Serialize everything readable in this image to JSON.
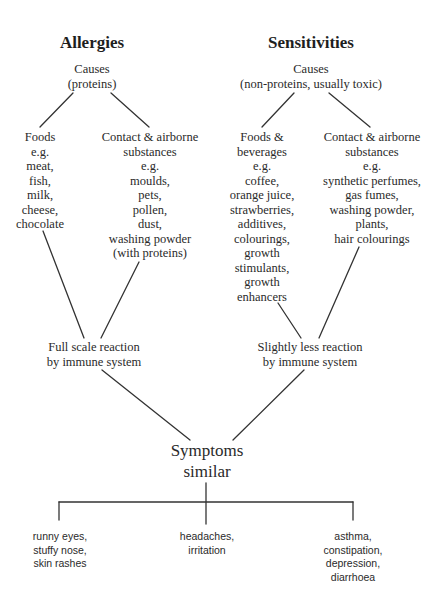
{
  "diagram": {
    "allergies": {
      "title": "Allergies",
      "causes": [
        "Causes",
        "(proteins)"
      ],
      "foods": [
        "Foods",
        "e.g.",
        "meat,",
        "fish,",
        "milk,",
        "cheese,",
        "chocolate"
      ],
      "contact": [
        "Contact & airborne",
        "substances",
        "e.g.",
        "moulds,",
        "pets,",
        "pollen,",
        "dust,",
        "washing powder",
        "(with proteins)"
      ],
      "reaction": [
        "Full scale reaction",
        "by immune system"
      ]
    },
    "sensitivities": {
      "title": "Sensitivities",
      "causes": [
        "Causes",
        "(non-proteins, usually toxic)"
      ],
      "foods": [
        "Foods &",
        "beverages",
        "e.g.",
        "coffee,",
        "orange juice,",
        "strawberries,",
        "additives,",
        "colourings,",
        "growth",
        "stimulants,",
        "growth",
        "enhancers"
      ],
      "contact": [
        "Contact & airborne",
        "substances",
        "e.g.",
        "synthetic perfumes,",
        "gas fumes,",
        "washing powder,",
        "plants,",
        "hair colourings"
      ],
      "reaction": [
        "Slightly less reaction",
        "by immune system"
      ]
    },
    "symptoms": {
      "title": [
        "Symptoms",
        "similar"
      ],
      "groups": [
        [
          "runny eyes,",
          "stuffy nose,",
          "skin rashes"
        ],
        [
          "headaches,",
          "irritation"
        ],
        [
          "asthma,",
          "constipation,",
          "depression,",
          "diarrhoea"
        ]
      ]
    },
    "colors": {
      "text": "#2a2a2a",
      "lines": "#333333",
      "background": "#ffffff"
    }
  }
}
